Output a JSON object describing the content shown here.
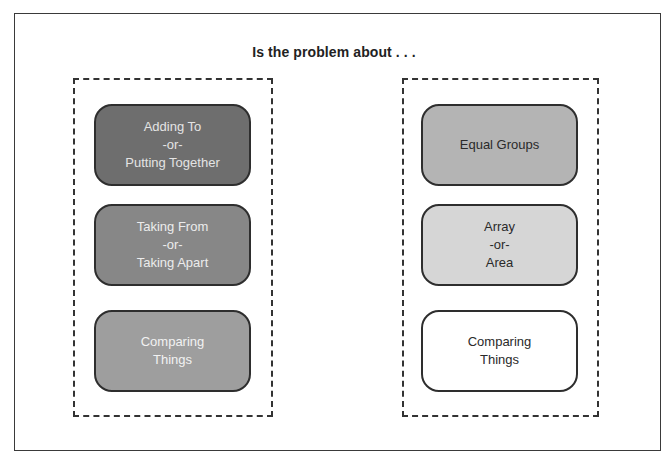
{
  "title": "Is the problem about . . .",
  "colors": {
    "frame_border": "#3a3a3a",
    "dashed_border": "#333333",
    "box_border": "#2e2e2e"
  },
  "groups": [
    {
      "name": "left",
      "boxes": [
        {
          "lines": [
            "Adding To",
            "-or-",
            "Putting Together"
          ],
          "fill": "#6e6e6e",
          "text_color": "#e4e4e4"
        },
        {
          "lines": [
            "Taking From",
            "-or-",
            "Taking Apart"
          ],
          "fill": "#878787",
          "text_color": "#ececec"
        },
        {
          "lines": [
            "Comparing",
            "Things"
          ],
          "fill": "#9e9e9e",
          "text_color": "#f2f2f2"
        }
      ]
    },
    {
      "name": "right",
      "boxes": [
        {
          "lines": [
            "Equal Groups"
          ],
          "fill": "#b4b4b4",
          "text_color": "#2a2a2a"
        },
        {
          "lines": [
            "Array",
            "-or-",
            "Area"
          ],
          "fill": "#d6d6d6",
          "text_color": "#2a2a2a"
        },
        {
          "lines": [
            "Comparing",
            "Things"
          ],
          "fill": "#ffffff",
          "text_color": "#2a2a2a"
        }
      ]
    }
  ]
}
